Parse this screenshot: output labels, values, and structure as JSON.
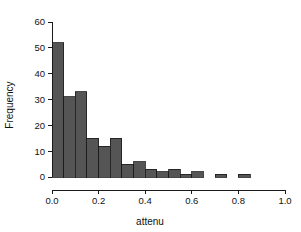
{
  "chart_data": {
    "type": "bar",
    "title": "",
    "subtitle": "",
    "xlabel": "attenu",
    "ylabel": "Frequency",
    "xlim": [
      0.0,
      1.0
    ],
    "ylim": [
      0,
      60
    ],
    "grid": false,
    "legend": null,
    "bin_width": 0.05,
    "bin_starts": [
      0.0,
      0.05,
      0.1,
      0.15,
      0.2,
      0.25,
      0.3,
      0.35,
      0.4,
      0.45,
      0.5,
      0.55,
      0.6,
      0.65,
      0.7,
      0.75,
      0.8
    ],
    "categories": [
      "0.00-0.05",
      "0.05-0.10",
      "0.10-0.15",
      "0.15-0.20",
      "0.20-0.25",
      "0.25-0.30",
      "0.30-0.35",
      "0.35-0.40",
      "0.40-0.45",
      "0.45-0.50",
      "0.50-0.55",
      "0.55-0.60",
      "0.60-0.65",
      "0.65-0.70",
      "0.70-0.75",
      "0.75-0.80",
      "0.80-0.85"
    ],
    "values": [
      52,
      31,
      33,
      15,
      12,
      15,
      5,
      6,
      3,
      2,
      3,
      1,
      2,
      0,
      1,
      0,
      1
    ],
    "xticks": [
      0.0,
      0.2,
      0.4,
      0.6,
      0.8,
      1.0
    ],
    "xtick_labels": [
      "0.0",
      "0.2",
      "0.4",
      "0.6",
      "0.8",
      "1.0"
    ],
    "yticks": [
      0,
      10,
      20,
      30,
      40,
      50,
      60
    ],
    "ytick_labels": [
      "0",
      "10",
      "20",
      "30",
      "40",
      "50",
      "60"
    ],
    "bar_color": "#555555",
    "bar_edge_color": "#1a1a1a",
    "axis_color": "#1a1a1a",
    "background_color": "#ffffff"
  }
}
